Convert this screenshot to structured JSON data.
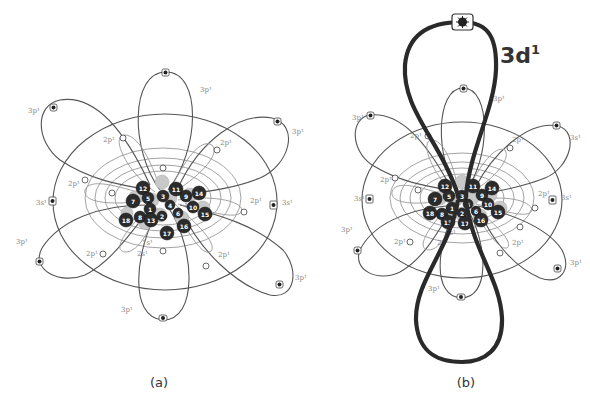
{
  "figure": {
    "panel_a": {
      "caption": "(a)",
      "orbital_labels": {
        "top": "3p¹",
        "upper_left": "3p¹",
        "upper_right": "3p¹",
        "left_s": "3s¹",
        "right_s": "3s¹",
        "lower_left": "3p¹",
        "bottom": "3p¹",
        "lower_right": "3p¹",
        "inner_2p_ul": "2p¹",
        "inner_2p_ur": "2p¹",
        "inner_2p_l": "2p¹",
        "inner_2p_r": "2p¹",
        "inner_2p_ll": "2p¹",
        "inner_2p_lr": "2p¹",
        "inner_2s": "2s¹",
        "inner_1s": "1s¹",
        "inner_1s_r": "1s¹"
      },
      "nucleus_numbers": [
        "12",
        "11",
        "14",
        "7",
        "5",
        "3",
        "9",
        "4",
        "1",
        "8",
        "15",
        "18",
        "13",
        "10",
        "2",
        "6",
        "17",
        "16"
      ]
    },
    "panel_b": {
      "caption": "(b)",
      "highlight_orbital": "3d",
      "highlight_superscript": "1",
      "orbital_labels": {
        "top": "3p¹",
        "upper_left": "3p¹",
        "upper_right": "3s¹",
        "left_s": "3s¹",
        "right_s": "3s¹",
        "lower_left": "3p¹",
        "bottom": "3p¹",
        "lower_right": "3p¹",
        "inner_2p_ul": "2p¹",
        "inner_2p_ur": "2p¹",
        "inner_2p_l": "2p¹",
        "inner_2p_r": "2p¹",
        "inner_2p_ll": "2p¹",
        "inner_2p_lr": "2p¹",
        "inner_2s": "2s¹",
        "inner_1s": "1s¹"
      },
      "nucleus_numbers": [
        "12",
        "11",
        "14",
        "7",
        "5",
        "3",
        "9",
        "4",
        "1",
        "8",
        "15",
        "18",
        "13",
        "10",
        "2",
        "6",
        "17",
        "16"
      ]
    }
  }
}
